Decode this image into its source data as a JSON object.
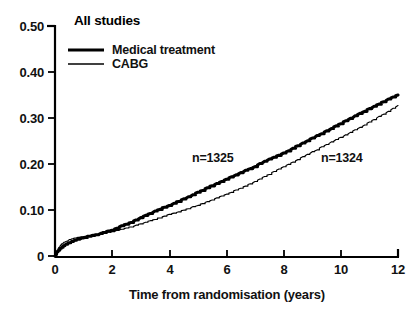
{
  "chart_data": {
    "type": "line",
    "title": "All studies",
    "xlabel": "Time from randomisation (years)",
    "ylabel": "",
    "xlim": [
      0,
      12
    ],
    "ylim": [
      0,
      0.5
    ],
    "xticks": [
      "0",
      "2",
      "4",
      "6",
      "8",
      "10",
      "12"
    ],
    "xtick_values": [
      0,
      2,
      4,
      6,
      8,
      10,
      12
    ],
    "yticks": [
      "0",
      "0.10",
      "0.20",
      "0.30",
      "0.40",
      "0.50"
    ],
    "ytick_values": [
      0,
      0.1,
      0.2,
      0.3,
      0.4,
      0.5
    ],
    "grid": false,
    "legend_position": "top-left",
    "legend": [
      {
        "label": "Medical treatment",
        "style": "thick",
        "color": "#000000"
      },
      {
        "label": "CABG",
        "style": "thin",
        "color": "#000000"
      }
    ],
    "annotations": [
      {
        "text": "n=1325",
        "x": 4.85,
        "y": 0.215,
        "series": "Medical treatment"
      },
      {
        "text": "n=1324",
        "x": 9.35,
        "y": 0.215,
        "series": "CABG"
      }
    ],
    "series": [
      {
        "name": "Medical treatment",
        "n": 1325,
        "style": "thick",
        "color": "#000000",
        "x": [
          0,
          0.08,
          0.17,
          0.25,
          0.35,
          0.5,
          0.65,
          0.8,
          1.0,
          1.2,
          1.4,
          1.6,
          1.8,
          2.0,
          2.25,
          2.5,
          2.75,
          3.0,
          3.25,
          3.5,
          3.75,
          4.0,
          4.25,
          4.5,
          4.75,
          5.0,
          5.25,
          5.5,
          5.75,
          6.0,
          6.25,
          6.5,
          6.75,
          7.0,
          7.25,
          7.5,
          7.75,
          8.0,
          8.25,
          8.5,
          8.75,
          9.0,
          9.25,
          9.5,
          9.75,
          10.0,
          10.25,
          10.5,
          10.75,
          11.0,
          11.25,
          11.5,
          11.75,
          12.0
        ],
        "y": [
          0.0,
          0.009,
          0.015,
          0.02,
          0.024,
          0.029,
          0.033,
          0.036,
          0.04,
          0.043,
          0.046,
          0.049,
          0.053,
          0.057,
          0.063,
          0.069,
          0.076,
          0.083,
          0.09,
          0.097,
          0.104,
          0.11,
          0.117,
          0.124,
          0.131,
          0.138,
          0.146,
          0.153,
          0.16,
          0.167,
          0.174,
          0.181,
          0.188,
          0.195,
          0.203,
          0.21,
          0.217,
          0.224,
          0.232,
          0.24,
          0.248,
          0.256,
          0.264,
          0.272,
          0.28,
          0.288,
          0.296,
          0.304,
          0.312,
          0.32,
          0.328,
          0.336,
          0.344,
          0.35
        ]
      },
      {
        "name": "CABG",
        "n": 1324,
        "style": "thin",
        "color": "#000000",
        "x": [
          0,
          0.08,
          0.17,
          0.25,
          0.35,
          0.5,
          0.65,
          0.8,
          1.0,
          1.2,
          1.4,
          1.6,
          1.8,
          2.0,
          2.25,
          2.5,
          2.75,
          3.0,
          3.25,
          3.5,
          3.75,
          4.0,
          4.25,
          4.5,
          4.75,
          5.0,
          5.25,
          5.5,
          5.75,
          6.0,
          6.25,
          6.5,
          6.75,
          7.0,
          7.25,
          7.5,
          7.75,
          8.0,
          8.25,
          8.5,
          8.75,
          9.0,
          9.25,
          9.5,
          9.75,
          10.0,
          10.25,
          10.5,
          10.75,
          11.0,
          11.25,
          11.5,
          11.75,
          12.0
        ],
        "y": [
          0.0,
          0.013,
          0.021,
          0.027,
          0.031,
          0.035,
          0.038,
          0.04,
          0.042,
          0.044,
          0.046,
          0.048,
          0.05,
          0.053,
          0.057,
          0.061,
          0.065,
          0.07,
          0.075,
          0.08,
          0.085,
          0.09,
          0.095,
          0.1,
          0.105,
          0.11,
          0.116,
          0.122,
          0.128,
          0.134,
          0.141,
          0.148,
          0.155,
          0.162,
          0.17,
          0.178,
          0.186,
          0.194,
          0.202,
          0.21,
          0.218,
          0.226,
          0.234,
          0.242,
          0.25,
          0.258,
          0.266,
          0.274,
          0.282,
          0.291,
          0.3,
          0.309,
          0.318,
          0.327
        ]
      }
    ]
  },
  "axes": {
    "y_tick_labels": [
      "0.50",
      "0.40",
      "0.30",
      "0.20",
      "0.10",
      "0"
    ],
    "x_tick_labels": [
      "0",
      "2",
      "4",
      "6",
      "8",
      "10",
      "12"
    ],
    "x_axis_title": "Time from randomisation (years)"
  },
  "title": "All studies",
  "legend": {
    "item_1": "Medical treatment",
    "item_2": "CABG"
  },
  "annotations": {
    "medical_n": "n=1325",
    "cabg_n": "n=1324"
  }
}
